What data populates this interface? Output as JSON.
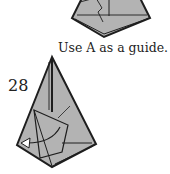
{
  "caption": "Use A as a guide.",
  "step_number": "28",
  "colors": {
    "paper": "#b3b3b3",
    "line": "#1e1e1e",
    "background": "#ffffff"
  }
}
